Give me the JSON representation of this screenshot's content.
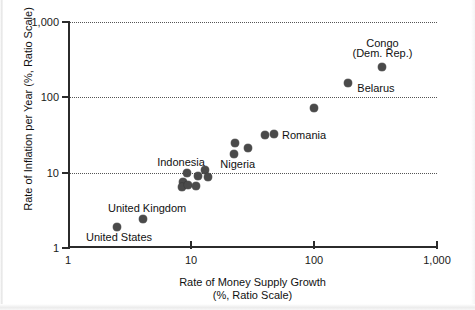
{
  "chart_data": {
    "type": "scatter",
    "title": "",
    "xlabel": "Rate of Money Supply Growth (%, Ratio Scale)",
    "xlabel_line1": "Rate of Money Supply Growth",
    "xlabel_line2": "(%, Ratio Scale)",
    "ylabel": "Rate of Inflation per Year (%, Ratio Scale)",
    "xscale": "log",
    "yscale": "log",
    "xlim": [
      1,
      1000
    ],
    "ylim": [
      1,
      1000
    ],
    "grid": "horizontal dotted at y = 10, 100, 1000",
    "legend": "none",
    "xticks": [
      {
        "value": 1,
        "label": "1"
      },
      {
        "value": 10,
        "label": "10"
      },
      {
        "value": 100,
        "label": "100"
      },
      {
        "value": 1000,
        "label": "1,000"
      }
    ],
    "yticks": [
      {
        "value": 1,
        "label": "1"
      },
      {
        "value": 10,
        "label": "10"
      },
      {
        "value": 100,
        "label": "100"
      },
      {
        "value": 1000,
        "label": "1,000"
      }
    ],
    "points": [
      {
        "name": "United States",
        "x": 2.5,
        "y": 1.9,
        "labeled": true
      },
      {
        "name": "United Kingdom",
        "x": 4.1,
        "y": 2.4,
        "labeled": true
      },
      {
        "name": "Indonesia",
        "x": 9.2,
        "y": 9.8,
        "labeled": true
      },
      {
        "name": "unlabeled-1",
        "x": 8.6,
        "y": 7.6,
        "labeled": false
      },
      {
        "name": "unlabeled-2",
        "x": 8.5,
        "y": 6.5,
        "labeled": false
      },
      {
        "name": "unlabeled-3",
        "x": 9.5,
        "y": 6.9,
        "labeled": false
      },
      {
        "name": "unlabeled-4",
        "x": 11.0,
        "y": 6.7,
        "labeled": false
      },
      {
        "name": "unlabeled-5",
        "x": 11.5,
        "y": 8.9,
        "labeled": false
      },
      {
        "name": "unlabeled-6",
        "x": 13.0,
        "y": 11.0,
        "labeled": false
      },
      {
        "name": "unlabeled-7",
        "x": 13.8,
        "y": 8.7,
        "labeled": false
      },
      {
        "name": "Nigeria",
        "x": 22.5,
        "y": 17.5,
        "labeled": true
      },
      {
        "name": "unlabeled-8",
        "x": 23.0,
        "y": 25.0,
        "labeled": false
      },
      {
        "name": "unlabeled-9",
        "x": 29.0,
        "y": 21.0,
        "labeled": false
      },
      {
        "name": "unlabeled-10",
        "x": 40.0,
        "y": 32.0,
        "labeled": false
      },
      {
        "name": "Romania",
        "x": 47.0,
        "y": 32.5,
        "labeled": true
      },
      {
        "name": "unlabeled-11",
        "x": 100.0,
        "y": 72.0,
        "labeled": false
      },
      {
        "name": "Belarus",
        "x": 190.0,
        "y": 155.0,
        "labeled": true
      },
      {
        "name": "Congo (Dem. Rep.)",
        "x": 360.0,
        "y": 250.0,
        "labeled": true
      }
    ],
    "annotations": [
      {
        "text": "United States",
        "anchor_x": 2.6,
        "anchor_y": 1.42,
        "align": "center"
      },
      {
        "text": "United Kingdom",
        "anchor_x": 4.4,
        "anchor_y": 3.35,
        "align": "center"
      },
      {
        "text": "Indonesia",
        "anchor_x": 8.3,
        "anchor_y": 14.0,
        "align": "center"
      },
      {
        "text": "Nigeria",
        "anchor_x": 24.0,
        "anchor_y": 13.2,
        "align": "center"
      },
      {
        "text": "Romania",
        "anchor_x": 55.0,
        "anchor_y": 32.0,
        "align": "left"
      },
      {
        "text": "Belarus",
        "anchor_x": 225.0,
        "anchor_y": 135.0,
        "align": "left"
      },
      {
        "text": "Congo",
        "anchor_x": 360.0,
        "anchor_y": 520.0,
        "align": "center"
      },
      {
        "text": "(Dem. Rep.)",
        "anchor_x": 360.0,
        "anchor_y": 390.0,
        "align": "center"
      }
    ],
    "colors": {
      "marker": "#4a4a4a",
      "axis": "#2b2b2b",
      "grid": "#555555",
      "text": "#111111",
      "background": "#ffffff"
    }
  }
}
